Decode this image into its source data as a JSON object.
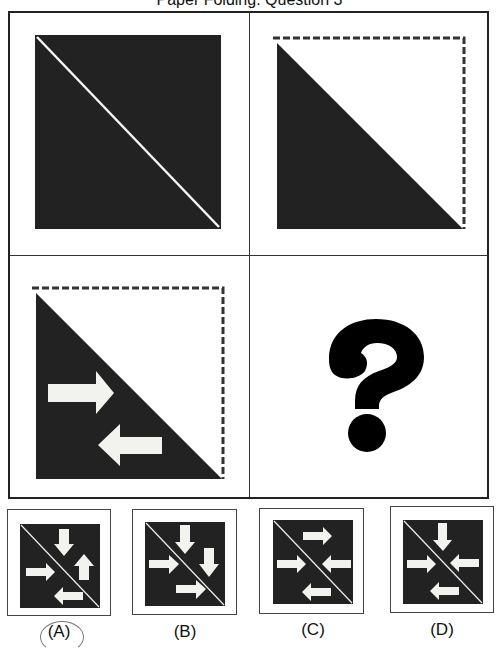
{
  "title": "Paper Folding: Question 3",
  "panels": [
    {
      "id": "step1",
      "description": "black square with white diagonal fold line"
    },
    {
      "id": "step2",
      "description": "square folded along diagonal, dashed outline of upper-right half"
    },
    {
      "id": "step3",
      "description": "folded triangle with two arrows punched: right arrow and left arrow"
    },
    {
      "id": "question",
      "symbol": "?"
    }
  ],
  "options": [
    {
      "label": "(A)",
      "selected": true
    },
    {
      "label": "(B)",
      "selected": false
    },
    {
      "label": "(C)",
      "selected": false
    },
    {
      "label": "(D)",
      "selected": false
    }
  ],
  "colors": {
    "fill": "#222222",
    "background": "#ffffff",
    "arrow": "#f2f2ee"
  }
}
